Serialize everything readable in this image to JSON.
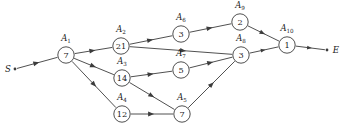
{
  "diagram": {
    "type": "activity-network-diagram",
    "title": "",
    "background_color": "#ffffff",
    "line_color": "#3c3c3c",
    "text_color": "#1a1a1a",
    "terminals": {
      "start": {
        "label": "S",
        "x": 12,
        "y": 69
      },
      "end": {
        "label": "E",
        "x": 331,
        "y": 50
      }
    },
    "nodes": [
      {
        "id": "A1",
        "label_base": "A",
        "label_sub": "1",
        "value": "7",
        "x": 66,
        "y": 55,
        "r": 8.2,
        "label_x": 66,
        "label_y": 41
      },
      {
        "id": "A2",
        "label_base": "A",
        "label_sub": "2",
        "value": "21",
        "x": 121,
        "y": 46,
        "r": 8.2,
        "label_x": 121,
        "label_y": 32
      },
      {
        "id": "A3",
        "label_base": "A",
        "label_sub": "3",
        "value": "14",
        "x": 122,
        "y": 78,
        "r": 8.2,
        "label_x": 122,
        "label_y": 64
      },
      {
        "id": "A4",
        "label_base": "A",
        "label_sub": "4",
        "value": "12",
        "x": 122,
        "y": 114,
        "r": 8.2,
        "label_x": 122,
        "label_y": 100
      },
      {
        "id": "A5",
        "label_base": "A",
        "label_sub": "5",
        "value": "7",
        "x": 182,
        "y": 114,
        "r": 8.2,
        "label_x": 182,
        "label_y": 100
      },
      {
        "id": "A6",
        "label_base": "A",
        "label_sub": "6",
        "value": "3",
        "x": 181,
        "y": 34,
        "r": 8.2,
        "label_x": 181,
        "label_y": 20
      },
      {
        "id": "A7",
        "label_base": "A",
        "label_sub": "7",
        "value": "5",
        "x": 181,
        "y": 70,
        "r": 8.2,
        "label_x": 181,
        "label_y": 56
      },
      {
        "id": "A8",
        "label_base": "A",
        "label_sub": "8",
        "value": "3",
        "x": 241,
        "y": 55,
        "r": 8.2,
        "label_x": 241,
        "label_y": 41
      },
      {
        "id": "A9",
        "label_base": "A",
        "label_sub": "9",
        "value": "2",
        "x": 240,
        "y": 22,
        "r": 8.2,
        "label_x": 240,
        "label_y": 8
      },
      {
        "id": "A10",
        "label_base": "A",
        "label_sub": "10",
        "value": "1",
        "x": 287,
        "y": 45,
        "r": 8.2,
        "label_x": 287,
        "label_y": 31
      }
    ],
    "edges": [
      {
        "id": "S-A1",
        "from": "S",
        "to": "A1"
      },
      {
        "id": "A1-A2",
        "from": "A1",
        "to": "A2"
      },
      {
        "id": "A1-A3",
        "from": "A1",
        "to": "A3"
      },
      {
        "id": "A1-A4",
        "from": "A1",
        "to": "A4"
      },
      {
        "id": "A2-A6",
        "from": "A2",
        "to": "A6"
      },
      {
        "id": "A2-A8",
        "from": "A2",
        "to": "A8"
      },
      {
        "id": "A3-A7",
        "from": "A3",
        "to": "A7"
      },
      {
        "id": "A3-A5",
        "from": "A3",
        "to": "A5"
      },
      {
        "id": "A4-A5",
        "from": "A4",
        "to": "A5"
      },
      {
        "id": "A5-A8",
        "from": "A5",
        "to": "A8"
      },
      {
        "id": "A6-A9",
        "from": "A6",
        "to": "A9"
      },
      {
        "id": "A7-A8",
        "from": "A7",
        "to": "A8"
      },
      {
        "id": "A8-A10",
        "from": "A8",
        "to": "A10"
      },
      {
        "id": "A9-A10",
        "from": "A9",
        "to": "A10"
      },
      {
        "id": "A10-E",
        "from": "A10",
        "to": "E"
      }
    ]
  }
}
